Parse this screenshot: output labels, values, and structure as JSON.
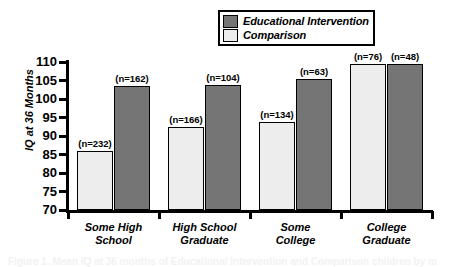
{
  "chart_data": {
    "type": "bar",
    "title": "",
    "xlabel": "",
    "ylabel": "IQ at 36 Months",
    "ylim": [
      70,
      110
    ],
    "yticks": [
      110,
      105,
      100,
      95,
      90,
      85,
      80,
      75,
      70
    ],
    "grid": false,
    "legend_position": "top-right",
    "categories": [
      "Some High\nSchool",
      "High School\nGraduate",
      "Some\nCollege",
      "College\nGraduate"
    ],
    "series": [
      {
        "name": "Comparison",
        "color": "#ededed",
        "values": [
          86.0,
          92.5,
          93.8,
          109.5
        ],
        "point_labels": [
          "(n=232)",
          "(n=166)",
          "(n=134)",
          "(n=76)"
        ]
      },
      {
        "name": "Educational Intervention",
        "color": "#757575",
        "values": [
          103.5,
          103.8,
          105.5,
          109.5
        ],
        "point_labels": [
          "(n=162)",
          "(n=104)",
          "(n=63)",
          "(n=48)"
        ]
      }
    ]
  },
  "legend": {
    "entries": [
      {
        "label": "Educational Intervention",
        "swatch": "dark"
      },
      {
        "label": "Comparison",
        "swatch": "light"
      }
    ]
  },
  "caption": {
    "text": "Figure 1. Mean IQ at 36 months of Educational Intervention and Comparison children by m"
  }
}
